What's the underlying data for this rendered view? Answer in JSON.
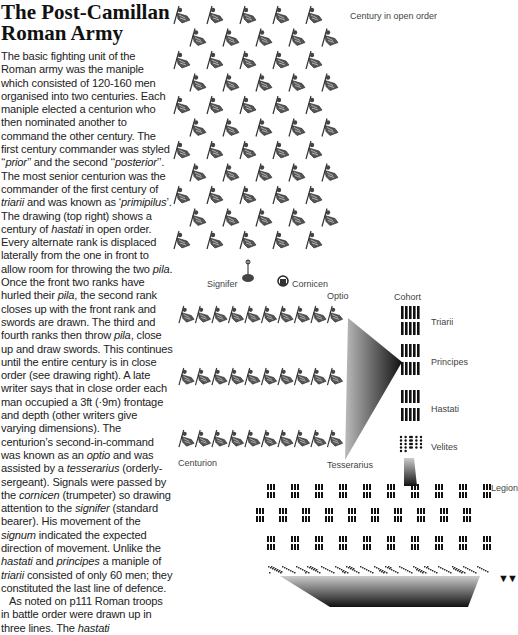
{
  "article": {
    "title_line1": "The Post-Camillan",
    "title_line2": "Roman Army",
    "paragraph1": [
      {
        "t": "The basic fighting unit of the Roman army was the maniple which consisted of 120-160 men organised into two centuries. Each maniple elected a centurion who then nominated another to command the other century. The first century commander was styled ‘‘"
      },
      {
        "i": "prior"
      },
      {
        "t": "’’ and the second ‘‘"
      },
      {
        "i": "posterior"
      },
      {
        "t": "’’. The most senior centurion was the commander of the first century of "
      },
      {
        "i": "triarii"
      },
      {
        "t": " and was known as ‘"
      },
      {
        "i": "primipilus"
      },
      {
        "t": "’. The drawing (top right) shows a century of "
      },
      {
        "i": "hastati"
      },
      {
        "t": " in open order. Every alternate rank is displaced laterally from the one in front to allow room for throwing the two "
      },
      {
        "i": "pila"
      },
      {
        "t": ". Once the front two ranks have hurled their "
      },
      {
        "i": "pila"
      },
      {
        "t": ", the second rank closes up with the front rank and swords are drawn. The third and fourth ranks then throw "
      },
      {
        "i": "pila"
      },
      {
        "t": ", close up and draw swords. This continues until the entire century is in close order (see drawing right). A late writer says that in close order each man occupied a 3ft (·9m) frontage and depth (other writers give varying dimensions). The centurion’s second-in-command was known as an "
      },
      {
        "i": "optio"
      },
      {
        "t": " and was assisted by a "
      },
      {
        "i": "tesserarius"
      },
      {
        "t": " (orderly-sergeant). Signals were passed by the "
      },
      {
        "i": "cornicen"
      },
      {
        "t": " (trumpeter) so drawing attention to the "
      },
      {
        "i": "signifer"
      },
      {
        "t": " (standard bearer). His movement of the "
      },
      {
        "i": "signum"
      },
      {
        "t": " indicated the expected direction of movement. Unlike the "
      },
      {
        "i": "hastati"
      },
      {
        "t": " and "
      },
      {
        "i": "principes"
      },
      {
        "t": " a maniple of "
      },
      {
        "i": "triarii"
      },
      {
        "t": " consisted of only 60 men; they constituted the last line of defence."
      }
    ],
    "paragraph2": [
      {
        "t": "As noted on p111 Roman troops in battle order were drawn up in three lines. The "
      },
      {
        "i": "hastati"
      }
    ]
  },
  "figure": {
    "open_order_label": "Century in open order",
    "signifer_label": "Signifer",
    "cornicen_label": "Cornicen",
    "optio_label": "Optio",
    "centurion_label": "Centurion",
    "tesserarius_label": "Tesserarius",
    "cohort_label": "Cohort",
    "triarii_label": "Triarii",
    "principes_label": "Principes",
    "hastati_label": "Hastati",
    "velites_label": "Velites",
    "legion_label": "Legion",
    "open_order_rows": 11,
    "open_order_cols": 5,
    "close_order_rows": 3,
    "close_order_cols": 10,
    "legion_rows": 3,
    "legion_cols": 10,
    "continuation_marker": "▼▼"
  }
}
